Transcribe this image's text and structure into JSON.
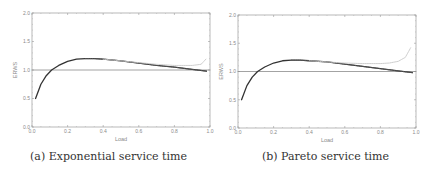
{
  "chart_data": [
    {
      "type": "line",
      "caption": "(a) Exponential service time",
      "title": "",
      "xlabel": "Load",
      "ylabel": "ERWS",
      "xlim": [
        0.0,
        1.0
      ],
      "ylim": [
        0.0,
        2.0
      ],
      "xticks": [
        "0.0",
        "0.2",
        "0.4",
        "0.6",
        "0.8",
        "1.0"
      ],
      "yticks": [
        "0.0",
        "0.5",
        "1.0",
        "1.5",
        "2.0"
      ],
      "grid": false,
      "series": [
        {
          "name": "reference",
          "style": "solid-gray",
          "x": [
            0.0,
            1.0
          ],
          "y": [
            1.0,
            1.0
          ]
        },
        {
          "name": "analytic",
          "style": "solid-dark",
          "x": [
            0.02,
            0.05,
            0.08,
            0.11,
            0.15,
            0.2,
            0.25,
            0.3,
            0.35,
            0.4,
            0.5,
            0.6,
            0.7,
            0.8,
            0.9,
            0.98
          ],
          "y": [
            0.5,
            0.75,
            0.9,
            1.0,
            1.08,
            1.15,
            1.19,
            1.2,
            1.2,
            1.19,
            1.16,
            1.12,
            1.08,
            1.05,
            1.01,
            0.98
          ]
        },
        {
          "name": "simulation",
          "style": "dotted-dark",
          "x": [
            0.3,
            0.35,
            0.4,
            0.5,
            0.6,
            0.7,
            0.8,
            0.9,
            0.98
          ],
          "y": [
            1.2,
            1.2,
            1.19,
            1.16,
            1.12,
            1.08,
            1.05,
            1.01,
            0.98
          ]
        },
        {
          "name": "approximation",
          "style": "light-gray",
          "x": [
            0.4,
            0.5,
            0.6,
            0.7,
            0.8,
            0.9,
            0.95,
            0.98
          ],
          "y": [
            1.19,
            1.16,
            1.13,
            1.1,
            1.08,
            1.08,
            1.1,
            1.2
          ]
        }
      ]
    },
    {
      "type": "line",
      "caption": "(b) Pareto service time",
      "title": "",
      "xlabel": "Load",
      "ylabel": "ERWS",
      "xlim": [
        0.0,
        1.0
      ],
      "ylim": [
        0.0,
        2.0
      ],
      "xticks": [
        "0.0",
        "0.2",
        "0.4",
        "0.6",
        "0.8",
        "1.0"
      ],
      "yticks": [
        "0.0",
        "0.5",
        "1.0",
        "1.5",
        "2.0"
      ],
      "grid": false,
      "series": [
        {
          "name": "reference",
          "style": "solid-gray",
          "x": [
            0.0,
            1.0
          ],
          "y": [
            1.0,
            1.0
          ]
        },
        {
          "name": "analytic",
          "style": "solid-dark",
          "x": [
            0.02,
            0.05,
            0.08,
            0.11,
            0.15,
            0.2,
            0.25,
            0.3,
            0.35,
            0.4,
            0.5,
            0.6,
            0.7,
            0.8,
            0.9,
            0.98
          ],
          "y": [
            0.5,
            0.75,
            0.9,
            1.0,
            1.08,
            1.15,
            1.19,
            1.2,
            1.2,
            1.19,
            1.17,
            1.13,
            1.09,
            1.05,
            1.01,
            0.98
          ]
        },
        {
          "name": "simulation",
          "style": "dotted-dark",
          "x": [
            0.3,
            0.35,
            0.4,
            0.5,
            0.6,
            0.7,
            0.8,
            0.9,
            0.98
          ],
          "y": [
            1.2,
            1.2,
            1.19,
            1.17,
            1.13,
            1.09,
            1.05,
            1.01,
            0.98
          ]
        },
        {
          "name": "approximation",
          "style": "light-gray",
          "x": [
            0.4,
            0.5,
            0.6,
            0.7,
            0.8,
            0.85,
            0.9,
            0.94,
            0.97
          ],
          "y": [
            1.19,
            1.17,
            1.15,
            1.14,
            1.14,
            1.15,
            1.18,
            1.25,
            1.42
          ]
        }
      ]
    }
  ]
}
